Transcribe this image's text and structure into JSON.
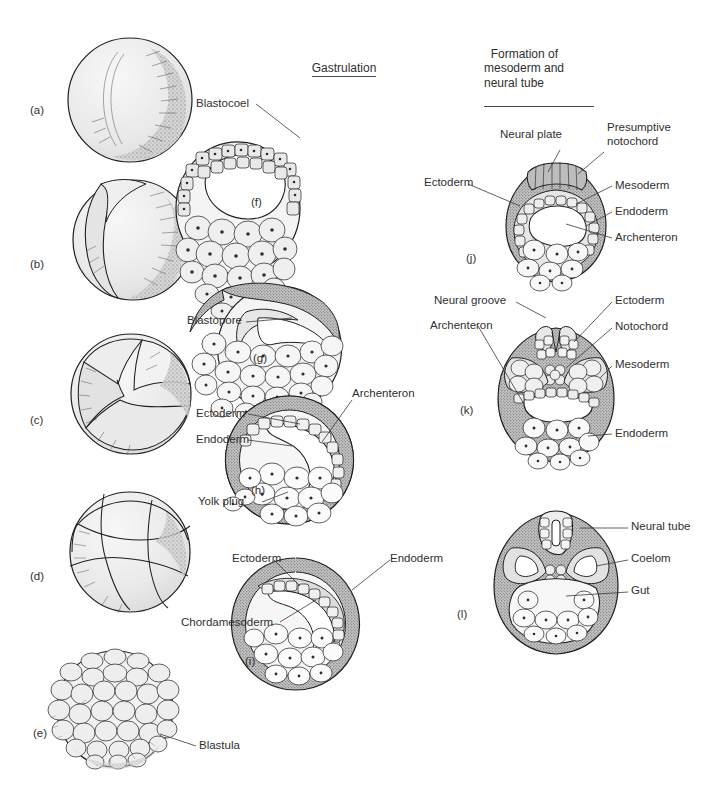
{
  "figure": {
    "title_columns": [
      {
        "id": "col-cleavage",
        "text": ""
      },
      {
        "id": "col-gastrulation",
        "text": "Gastrulation"
      },
      {
        "id": "col-formation",
        "text": "Formation of\nmesoderm and\nneural tube"
      }
    ]
  },
  "panels": [
    {
      "id": "a",
      "label": "(a)",
      "caption": "Fertilized egg with grey crescent"
    },
    {
      "id": "b",
      "label": "(b)",
      "caption": "Two-cell stage"
    },
    {
      "id": "c",
      "label": "(c)",
      "caption": "Four-cell stage"
    },
    {
      "id": "d",
      "label": "(d)",
      "caption": "Eight-cell stage"
    },
    {
      "id": "e",
      "label": "(e)",
      "caption": "Blastula"
    },
    {
      "id": "f",
      "label": "(f)",
      "caption": "Blastula section"
    },
    {
      "id": "g",
      "label": "(g)",
      "caption": "Early gastrula"
    },
    {
      "id": "h",
      "label": "(h)",
      "caption": "Mid gastrula"
    },
    {
      "id": "i",
      "label": "(i)",
      "caption": "Late gastrula"
    },
    {
      "id": "j",
      "label": "(j)",
      "caption": "Neural plate stage"
    },
    {
      "id": "k",
      "label": "(k)",
      "caption": "Neural groove stage"
    },
    {
      "id": "l",
      "label": "(l)",
      "caption": "Neural tube stage"
    }
  ],
  "annotations": {
    "blastocoel": "Blastocoel",
    "blastopore": "Blastopore",
    "archenteron_h": "Archenteron",
    "ectoderm_h": "Ectoderm",
    "endoderm_h": "Endoderm",
    "yolk_plug": "Yolk plug",
    "ectoderm_i": "Ectoderm",
    "endoderm_i": "Endoderm",
    "chordamesoderm": "Chordamesoderm",
    "blastula": "Blastula",
    "neural_plate": "Neural plate",
    "presumptive_notochord": "Presumptive\nnotochord",
    "ectoderm_j": "Ectoderm",
    "mesoderm_j": "Mesoderm",
    "endoderm_j": "Endoderm",
    "archenteron_j": "Archenteron",
    "neural_groove": "Neural groove",
    "archenteron_k": "Archenteron",
    "ectoderm_k": "Ectoderm",
    "notochord_k": "Notochord",
    "mesoderm_k": "Mesoderm",
    "endoderm_k": "Endoderm",
    "neural_tube": "Neural tube",
    "coelom": "Coelom",
    "gut": "Gut"
  },
  "colors": {
    "ink": "#1f1f1f",
    "text": "#2f2f2f",
    "cell_fill": "#ededed",
    "cell_fill_light": "#f5f5f5",
    "ectoderm_fill": "#cfcfcf",
    "leader": "#3a3a3a",
    "page_bg": "#ffffff"
  }
}
